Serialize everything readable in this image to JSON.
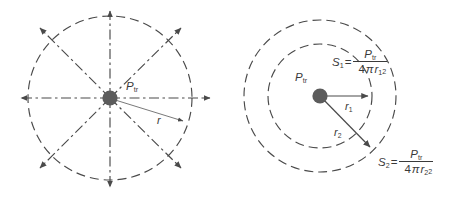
{
  "figure": {
    "background_color": "#ffffff",
    "stroke_color": "#4a4a4a",
    "text_color": "#3a3a3a",
    "dot_color": "#5a5a5a"
  },
  "left_diagram": {
    "name": "isotropic-radiation-diagram",
    "center_label": "P",
    "center_label_sub": "tr",
    "radius_label": "r",
    "circle": {
      "cx": 110,
      "cy": 98,
      "r": 82
    },
    "source_dot": {
      "cx": 110,
      "cy": 98,
      "r": 7.5
    },
    "ray_count": 8,
    "ray_arrow_tips": [
      {
        "angle_deg": 0,
        "x": 213,
        "y": 98
      },
      {
        "angle_deg": 45,
        "x": 183,
        "y": 25
      },
      {
        "angle_deg": 90,
        "x": 110,
        "y": 8
      },
      {
        "angle_deg": 135,
        "x": 37,
        "y": 25
      },
      {
        "angle_deg": 180,
        "x": 18,
        "y": 98
      },
      {
        "angle_deg": 225,
        "x": 37,
        "y": 171
      },
      {
        "angle_deg": 270,
        "x": 110,
        "y": 190
      },
      {
        "angle_deg": 315,
        "x": 183,
        "y": 171
      }
    ],
    "radius_arrow": {
      "x1": 110,
      "y1": 98,
      "x2": 186,
      "y2": 122
    }
  },
  "right_diagram": {
    "name": "power-density-spheres-diagram",
    "center_label": "P",
    "center_label_sub": "tr",
    "source_dot": {
      "cx": 320,
      "cy": 96,
      "r": 7.5
    },
    "inner_circle": {
      "cx": 320,
      "cy": 96,
      "r": 52
    },
    "outer_circle": {
      "cx": 320,
      "cy": 96,
      "r": 76
    },
    "r1_label": "r",
    "r1_sub": "1",
    "r2_label": "r",
    "r2_sub": "2",
    "r1_arrow": {
      "x1": 320,
      "y1": 96,
      "x2": 371,
      "y2": 96
    },
    "r2_arrow": {
      "x1": 320,
      "y1": 96,
      "x2": 373,
      "y2": 150
    },
    "equation_1": {
      "lhs": "S",
      "lhs_sub": "1",
      "equals": "=",
      "numerator": "P",
      "numerator_sub": "tr",
      "denominator_prefix": "4",
      "denominator_pi": "π",
      "denominator_var": "r",
      "denominator_sub": "1",
      "denominator_exp": "2"
    },
    "equation_2": {
      "lhs": "S",
      "lhs_sub": "2",
      "equals": "=",
      "numerator": "P",
      "numerator_sub": "tr",
      "denominator_prefix": "4",
      "denominator_pi": "π",
      "denominator_var": "r",
      "denominator_sub": "2",
      "denominator_exp": "2"
    }
  }
}
